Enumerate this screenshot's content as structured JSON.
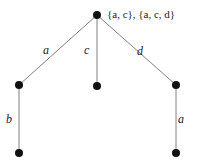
{
  "diagram": {
    "type": "tree-graph",
    "title": "",
    "background_color": "#ffffff",
    "node_color": "#111111",
    "edge_color": "#808080",
    "label_color": "#1a1a1a",
    "nodes": [
      {
        "id": "root",
        "name": "root-node",
        "x": 97,
        "y": 15,
        "r": 4.0
      },
      {
        "id": "left-mid",
        "name": "left-middle-node",
        "x": 19,
        "y": 85,
        "r": 4.0
      },
      {
        "id": "center-mid",
        "name": "center-middle-node",
        "x": 97,
        "y": 86,
        "r": 4.0
      },
      {
        "id": "right-mid",
        "name": "right-middle-node",
        "x": 176,
        "y": 85,
        "r": 4.0
      },
      {
        "id": "left-bottom",
        "name": "left-bottom-node",
        "x": 19,
        "y": 153,
        "r": 4.0
      },
      {
        "id": "right-bottom",
        "name": "right-bottom-node",
        "x": 176,
        "y": 153,
        "r": 4.0
      }
    ],
    "edges": [
      {
        "id": "e-root-left",
        "from": "root",
        "to": "left-mid",
        "label": "a"
      },
      {
        "id": "e-root-center",
        "from": "root",
        "to": "center-mid",
        "label": "c"
      },
      {
        "id": "e-root-right",
        "from": "root",
        "to": "right-mid",
        "label": "d"
      },
      {
        "id": "e-left-leftbottom",
        "from": "left-mid",
        "to": "left-bottom",
        "label": "b"
      },
      {
        "id": "e-right-rightbottom",
        "from": "right-mid",
        "to": "right-bottom",
        "label": "a"
      }
    ],
    "edge_labels": [
      {
        "id": "lbl-a-left",
        "text": "a",
        "x": 47,
        "y": 50
      },
      {
        "id": "lbl-c-center",
        "text": "c",
        "x": 88,
        "y": 50
      },
      {
        "id": "lbl-d-right",
        "text": "d",
        "x": 141,
        "y": 51
      },
      {
        "id": "lbl-b-left",
        "text": "b",
        "x": 9,
        "y": 119
      },
      {
        "id": "lbl-a-right",
        "text": "a",
        "x": 181,
        "y": 119
      }
    ],
    "root_label": {
      "id": "root-set-label",
      "text": "{a, c}, {a, c, d}",
      "parts": [
        "{",
        "a",
        ", ",
        "c",
        "}, {",
        "a",
        ", ",
        "c",
        ", ",
        "d",
        "}"
      ],
      "x": 107,
      "y": 10
    }
  }
}
